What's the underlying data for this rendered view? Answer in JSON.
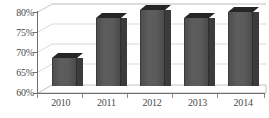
{
  "chart_data": {
    "type": "bar",
    "title": "",
    "subtitle": "",
    "xlabel": "",
    "ylabel": "",
    "categories": [
      "2010",
      "2011",
      "2012",
      "2013",
      "2014"
    ],
    "values": [
      67,
      77,
      79,
      77,
      78.5
    ],
    "ylim": [
      60,
      80
    ],
    "y_ticks": [
      "60%",
      "65%",
      "70%",
      "75%",
      "80%"
    ],
    "y_tick_values": [
      60,
      65,
      70,
      75,
      80
    ],
    "grid": true,
    "legend": false,
    "legend_position": "none",
    "style": "3d-column",
    "colors": {
      "bar_face": "#565656",
      "bar_top": "#262626",
      "bar_side": "#3b3b3b",
      "gridline": "#d9d9d9",
      "axis": "#6f6f6f",
      "text": "#4a4a4a",
      "background": "#ffffff"
    }
  }
}
